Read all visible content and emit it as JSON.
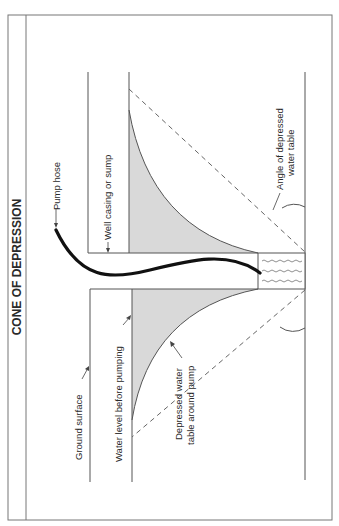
{
  "diagram": {
    "title": "CONE OF DEPRESSION",
    "labels": {
      "pump_hose": "Pump hose",
      "well_casing": "Well casing or sump",
      "angle_line1": "Angle of depressed",
      "angle_line2": "water table",
      "ground_surface": "Ground surface",
      "water_level": "Water level before pumping",
      "depressed_line1": "Depressed water",
      "depressed_line2": "table around pump"
    },
    "colors": {
      "line": "#555555",
      "shade": "#d9d9d9",
      "hose": "#111111",
      "frame": "#777777"
    }
  }
}
